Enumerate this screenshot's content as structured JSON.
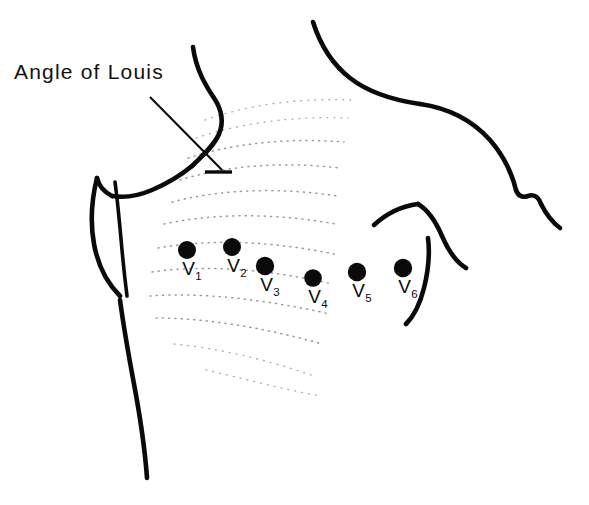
{
  "figure": {
    "title": "Angle of Louis",
    "background_color": "#ffffff",
    "ink_color": "#0a0a0a",
    "rib_color": "#9a9a9a",
    "width": 589,
    "height": 505
  },
  "annotations": [
    {
      "name": "angle-of-louis",
      "label": "Angle of Louis",
      "x": 14,
      "y": 60,
      "leader_from": [
        150,
        97
      ],
      "leader_to": [
        222,
        170
      ],
      "tick_from": [
        205,
        172
      ],
      "tick_to": [
        232,
        172
      ]
    }
  ],
  "electrodes": [
    {
      "id": "V1",
      "label": "V",
      "subscript": "1",
      "dot_x": 187,
      "dot_y": 250,
      "dot_r": 9.0,
      "label_x": 192,
      "label_y": 258
    },
    {
      "id": "V2",
      "label": "V",
      "subscript": "2",
      "dot_x": 232,
      "dot_y": 247,
      "dot_r": 9.0,
      "label_x": 237,
      "label_y": 255
    },
    {
      "id": "V3",
      "label": "V",
      "subscript": "3",
      "dot_x": 265,
      "dot_y": 266,
      "dot_r": 9.2,
      "label_x": 270,
      "label_y": 274
    },
    {
      "id": "V4",
      "label": "V",
      "subscript": "4",
      "dot_x": 313,
      "dot_y": 278,
      "dot_r": 8.8,
      "label_x": 318,
      "label_y": 286
    },
    {
      "id": "V5",
      "label": "V",
      "subscript": "5",
      "dot_x": 357,
      "dot_y": 272,
      "dot_r": 9.2,
      "label_x": 362,
      "label_y": 280
    },
    {
      "id": "V6",
      "label": "V",
      "subscript": "6",
      "dot_x": 403,
      "dot_y": 268,
      "dot_r": 9.2,
      "label_x": 408,
      "label_y": 276
    }
  ],
  "outlines": {
    "neck_left": "M 193 47 C 196 70, 206 86, 214 98 C 222 110, 224 122, 219 134 C 214 146, 202 156, 192 166",
    "shoulder_left": "M 192 166 C 180 176, 166 184, 152 190 C 138 196, 124 198, 112 196",
    "torso_left_upper": "M 112 196 C 104 192, 99 186, 97 178",
    "axilla_outer": "M 97 178 C 92 198, 90 222, 94 244 C 98 266, 108 284, 120 296",
    "axilla_inner": "M 115 182 C 118 204, 120 228, 122 250 C 124 272, 126 288, 127 296",
    "torso_left_lower": "M 120 300 C 123 322, 128 352, 134 384 C 140 416, 145 450, 147 478",
    "shoulder_right": "M 313 22 C 320 44, 332 64, 350 78 C 368 92, 392 100, 420 104",
    "arm_right_upper": "M 420 104 C 448 108, 472 120, 490 140 C 504 156, 512 174, 516 190",
    "arm_right_notch": "M 516 190 C 518 196, 522 198, 528 196 C 534 194, 538 196, 541 204",
    "arm_right_lower": "M 541 204 C 546 214, 552 222, 560 228",
    "breast_right_upper": "M 374 225 C 386 214, 402 206, 418 204",
    "breast_right_lateral": "M 418 204 C 428 210, 436 222, 442 236 C 448 250, 456 262, 466 268",
    "breast_right_medial": "M 428 238 C 430 254, 428 272, 424 288 C 420 304, 414 316, 406 324"
  },
  "ribs": [
    "M 205 120 C 250 104, 300 98, 352 100",
    "M 196 138 C 244 122, 296 116, 348 118",
    "M 188 158 C 238 142, 292 138, 344 142",
    "M 180 180 C 232 164, 288 162, 340 168",
    "M 172 202 C 226 188, 284 188, 338 196",
    "M 164 224 C 220 212, 280 214, 336 224",
    "M 158 248 C 214 238, 276 242, 334 254",
    "M 152 272 C 208 264, 272 270, 332 284",
    "M 150 296 C 204 292, 268 300, 330 314",
    "M 156 318 C 206 318, 266 328, 322 344",
    "M 174 344 C 218 348, 268 360, 314 376",
    "M 206 370 C 242 378, 284 390, 322 396"
  ]
}
